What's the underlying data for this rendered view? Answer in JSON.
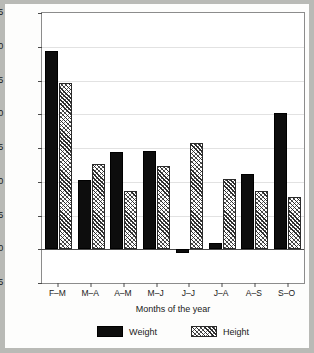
{
  "chart_data": {
    "type": "bar",
    "title": "",
    "xlabel": "Months of the year",
    "ylabel": "Per cent of total",
    "categories": [
      "F–M",
      "M–A",
      "A–M",
      "M–J",
      "J–J",
      "J–A",
      "A–S",
      "S–O"
    ],
    "series": [
      {
        "name": "Weight",
        "color": "#0d0d0d",
        "fill": "solid",
        "values": [
          29.3,
          10.2,
          14.4,
          14.6,
          -0.5,
          0.9,
          11.2,
          20.2
        ]
      },
      {
        "name": "Height",
        "color": "#2b2b2b",
        "fill": "hatched",
        "values": [
          24.6,
          12.6,
          8.6,
          12.3,
          15.7,
          10.4,
          8.6,
          7.7
        ]
      }
    ],
    "ylim": [
      -5,
      35
    ],
    "yticks": [
      -5,
      0,
      5,
      10,
      15,
      20,
      25,
      30,
      35
    ],
    "ytick_labels": [
      "-5",
      "0",
      "5",
      "10",
      "15",
      "20",
      "25",
      "30",
      "35"
    ],
    "grid": true,
    "legend_position": "bottom-center"
  },
  "legend": {
    "entries": [
      {
        "label": "Weight"
      },
      {
        "label": "Height"
      }
    ]
  }
}
